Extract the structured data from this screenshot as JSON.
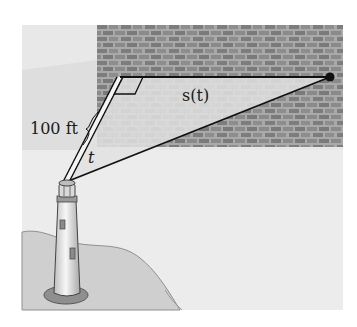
{
  "figure": {
    "labels": {
      "distance": "100 ft",
      "spot_position": "s(t)",
      "angle": "t"
    },
    "colors": {
      "background_panel": "#e6e6e6",
      "wall": "#a9a9a9",
      "brick": "#7d7d7d",
      "beam_region": "#dcdcdc",
      "line": "#111111",
      "land": "#cfcfcf",
      "lighthouse_body": "#f2f2f2",
      "lighthouse_base": "#8a8a8a"
    }
  }
}
